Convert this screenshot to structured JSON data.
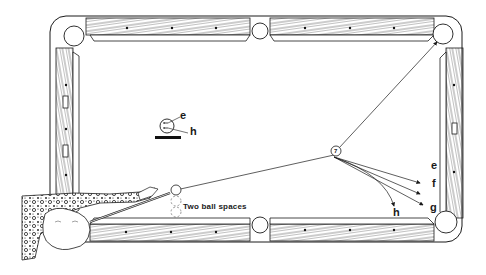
{
  "diagram": {
    "object_ball": {
      "number": "7"
    },
    "path_labels": [
      "e",
      "f",
      "g",
      "h"
    ],
    "cue_ball_inset": {
      "labels": [
        "e",
        "h"
      ]
    },
    "annotation": "Two ball spaces",
    "colors": {
      "ink": "#1a1a1a",
      "background": "#ffffff"
    }
  }
}
